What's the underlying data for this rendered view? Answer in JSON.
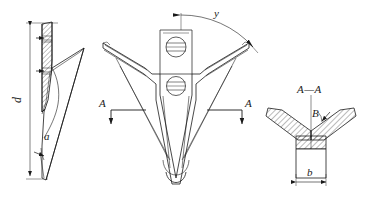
{
  "drawing": {
    "title": "V-shaped sweep share — three-view engineering drawing",
    "type": "technical-line-drawing",
    "line_color": "#1a1a1a",
    "hatch_color": "#1a1a1a",
    "background": "#ffffff",
    "views": [
      {
        "id": "side-view",
        "name": "Side elevation (left view)",
        "labels": [
          "d",
          "a"
        ]
      },
      {
        "id": "plan-view",
        "name": "Plan view (top view)",
        "labels": [
          "y",
          "A",
          "A"
        ]
      },
      {
        "id": "section-view",
        "name": "Section A—A",
        "labels": [
          "A—A",
          "B",
          "b"
        ]
      }
    ]
  },
  "labels": {
    "depth_d": "d",
    "angle_alpha": "a",
    "angle_gamma": "y",
    "angle_beta": "B",
    "width_b": "b",
    "section_mark_left": "A",
    "section_mark_right": "A",
    "section_title": "A—A"
  }
}
